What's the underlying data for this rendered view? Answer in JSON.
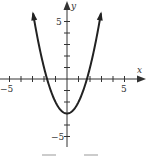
{
  "chart_data": {
    "type": "line",
    "title": "",
    "function": "y = x^2 - 3",
    "xlabel": "x",
    "ylabel": "y",
    "xlim": [
      -5.5,
      6
    ],
    "ylim": [
      -6,
      7
    ],
    "x_tick_labels": [
      "-5",
      "5"
    ],
    "y_tick_labels": [
      "5",
      "-5"
    ],
    "grid": false,
    "series": [
      {
        "name": "parabola",
        "x": [
          -3,
          -2,
          -1,
          0,
          1,
          2,
          3
        ],
        "values": [
          6,
          1,
          -2,
          -3,
          -2,
          1,
          6
        ]
      }
    ],
    "vertex": [
      0,
      -3
    ],
    "x_intercepts": [
      -1.73,
      1.73
    ]
  },
  "labels": {
    "x_axis": "x",
    "y_axis": "y",
    "x_min": "−5",
    "x_max": "5",
    "y_max": "5",
    "y_min": "−5"
  },
  "colors": {
    "curve": "#222222",
    "axis": "#333333"
  }
}
